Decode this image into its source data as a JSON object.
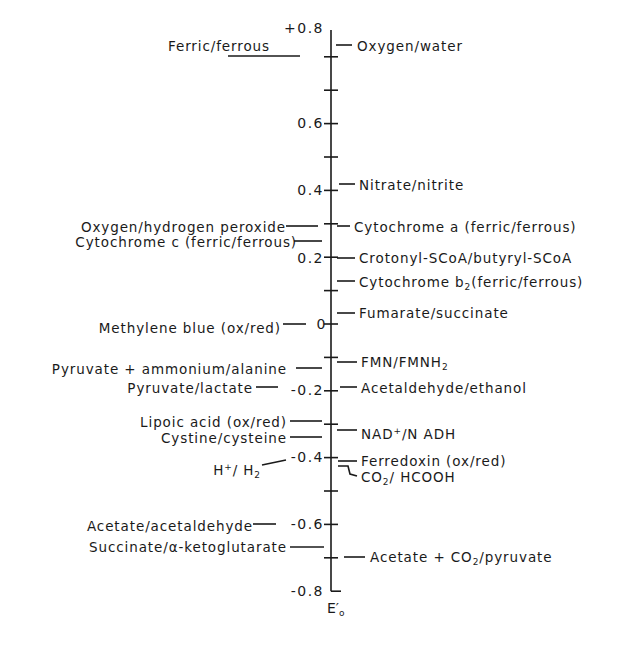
{
  "diagram": {
    "axis": {
      "label": "E'o",
      "label_main": "E",
      "label_prime": "′",
      "label_sub": "o",
      "min": -0.8,
      "max": 0.8,
      "major_ticks": [
        {
          "value": 0.8,
          "label": "+0.8"
        },
        {
          "value": 0.6,
          "label": "0.6"
        },
        {
          "value": 0.4,
          "label": "0.4"
        },
        {
          "value": 0.2,
          "label": "0.2"
        },
        {
          "value": 0.0,
          "label": "0"
        },
        {
          "value": -0.2,
          "label": "-0.2"
        },
        {
          "value": -0.4,
          "label": "-0.4"
        },
        {
          "value": -0.6,
          "label": "-0.6"
        },
        {
          "value": -0.8,
          "label": "-0.8"
        }
      ],
      "minor_ticks": [
        0.7,
        0.5,
        0.3,
        0.1,
        -0.1,
        -0.3,
        -0.5,
        -0.7
      ]
    },
    "left_couples": [
      {
        "id": "ferric-ferrous",
        "label": "Ferric/ferrous",
        "value": 0.77
      },
      {
        "id": "oxygen-hydrogen-peroxide",
        "label": "Oxygen/hydrogen peroxide",
        "value": 0.3
      },
      {
        "id": "cytochrome-c",
        "label": "Cytochrome c (ferric/ferrous)",
        "value": 0.25
      },
      {
        "id": "methylene-blue",
        "label": "Methylene blue (ox/red)",
        "value": 0.01
      },
      {
        "id": "pyruvate-ammonium-alanine",
        "label": "Pyruvate + ammonium/alanine",
        "value": -0.13
      },
      {
        "id": "pyruvate-lactate",
        "label": "Pyruvate/lactate",
        "value": -0.19
      },
      {
        "id": "lipoic-acid",
        "label": "Lipoic acid (ox/red)",
        "value": -0.29
      },
      {
        "id": "cystine-cysteine",
        "label": "Cystine/cysteine",
        "value": -0.34
      },
      {
        "id": "h-h2",
        "label_parts": [
          "H",
          "+",
          "/ H",
          "2"
        ],
        "label": "H+/H2",
        "value": -0.42
      },
      {
        "id": "acetate-acetaldehyde",
        "label": "Acetate/acetaldehyde",
        "value": -0.6
      },
      {
        "id": "succinate-ketoglutarate",
        "label": "Succinate/α-ketoglutarate",
        "value": -0.67
      }
    ],
    "right_couples": [
      {
        "id": "oxygen-water",
        "label": "Oxygen/water",
        "value": 0.82
      },
      {
        "id": "nitrate-nitrite",
        "label": "Nitrate/nitrite",
        "value": 0.42
      },
      {
        "id": "cytochrome-a",
        "label": "Cytochrome a (ferric/ferrous)",
        "value": 0.29
      },
      {
        "id": "crotonyl-butyryl",
        "label": "Crotonyl-SCoA/butyryl-SCoA",
        "value": 0.19
      },
      {
        "id": "cytochrome-b2",
        "label_parts": [
          "Cytochrome b",
          "2",
          "(ferric/ferrous)"
        ],
        "label": "Cytochrome b2(ferric/ferrous)",
        "value": 0.12
      },
      {
        "id": "fumarate-succinate",
        "label": "Fumarate/succinate",
        "value": 0.03
      },
      {
        "id": "fmn-fmnh2",
        "label_parts": [
          "FMN/FMNH",
          "2"
        ],
        "label": "FMN/FMNH2",
        "value": -0.12
      },
      {
        "id": "acetaldehyde-ethanol",
        "label": "Acetaldehyde/ethanol",
        "value": -0.2
      },
      {
        "id": "nad-nadh",
        "label_parts": [
          "NAD",
          "+",
          "/N ADH"
        ],
        "label": "NAD+/NADH",
        "value": -0.32
      },
      {
        "id": "ferredoxin",
        "label": "Ferredoxin (ox/red)",
        "value": -0.41
      },
      {
        "id": "co2-hcooh",
        "label_parts": [
          "CO",
          "2",
          "/ HCOOH"
        ],
        "label": "CO2/HCOOH",
        "value": -0.42
      },
      {
        "id": "acetate-co2-pyruvate",
        "label_parts": [
          "Acetate + CO",
          "2",
          "/pyruvate"
        ],
        "label": "Acetate + CO2/pyruvate",
        "value": -0.7
      }
    ],
    "colors": {
      "ink": "#1a1a1a",
      "background": "#ffffff"
    }
  }
}
